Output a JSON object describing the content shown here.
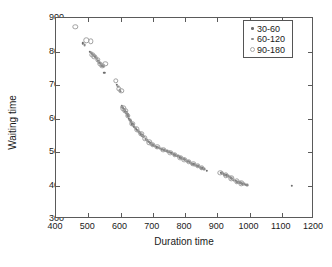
{
  "chart_data": {
    "type": "scatter",
    "title": "",
    "xlabel": "Duration time",
    "ylabel": "Waiting time",
    "xlim": [
      400,
      1200
    ],
    "ylim": [
      300,
      900
    ],
    "xticks": [
      400,
      500,
      600,
      700,
      800,
      900,
      1000,
      1100,
      1200
    ],
    "yticks": [
      300,
      400,
      500,
      600,
      700,
      800,
      900
    ],
    "grid": false,
    "legend_position": "top-right",
    "series": [
      {
        "name": "30-60",
        "color": "#6d6d6d",
        "marker": "dot",
        "points": [
          [
            484,
            824
          ],
          [
            505,
            800
          ],
          [
            511,
            793
          ],
          [
            521,
            786
          ],
          [
            527,
            779
          ],
          [
            534,
            766
          ],
          [
            541,
            759
          ],
          [
            550,
            737
          ],
          [
            588,
            700
          ],
          [
            597,
            684
          ],
          [
            604,
            636
          ],
          [
            607,
            632
          ],
          [
            610,
            628
          ],
          [
            613,
            622
          ],
          [
            617,
            618
          ],
          [
            621,
            612
          ],
          [
            626,
            600
          ],
          [
            631,
            592
          ],
          [
            637,
            583
          ],
          [
            642,
            576
          ],
          [
            648,
            570
          ],
          [
            651,
            566
          ],
          [
            657,
            560
          ],
          [
            663,
            552
          ],
          [
            668,
            548
          ],
          [
            673,
            545
          ],
          [
            681,
            536
          ],
          [
            687,
            530
          ],
          [
            692,
            527
          ],
          [
            698,
            522
          ],
          [
            705,
            518
          ],
          [
            712,
            514
          ],
          [
            719,
            512
          ],
          [
            729,
            508
          ],
          [
            740,
            504
          ],
          [
            748,
            501
          ],
          [
            757,
            497
          ],
          [
            766,
            493
          ],
          [
            774,
            489
          ],
          [
            783,
            484
          ],
          [
            791,
            480
          ],
          [
            800,
            476
          ],
          [
            809,
            472
          ],
          [
            818,
            468
          ],
          [
            827,
            463
          ],
          [
            836,
            459
          ],
          [
            845,
            455
          ],
          [
            854,
            451
          ],
          [
            868,
            444
          ],
          [
            912,
            437
          ],
          [
            920,
            434
          ],
          [
            929,
            431
          ],
          [
            938,
            426
          ],
          [
            946,
            420
          ],
          [
            957,
            414
          ],
          [
            968,
            409
          ],
          [
            978,
            405
          ],
          [
            988,
            402
          ],
          [
            1131,
            400
          ]
        ]
      },
      {
        "name": "60-120",
        "color": "#8a8a8a",
        "marker": "dot",
        "points": [
          [
            489,
            820
          ],
          [
            509,
            797
          ],
          [
            516,
            789
          ],
          [
            524,
            782
          ],
          [
            531,
            772
          ],
          [
            538,
            762
          ],
          [
            545,
            756
          ],
          [
            592,
            695
          ],
          [
            600,
            680
          ],
          [
            606,
            634
          ],
          [
            612,
            625
          ],
          [
            616,
            620
          ],
          [
            619,
            615
          ],
          [
            624,
            606
          ],
          [
            629,
            596
          ],
          [
            634,
            588
          ],
          [
            640,
            580
          ],
          [
            645,
            573
          ],
          [
            654,
            563
          ],
          [
            660,
            556
          ],
          [
            666,
            550
          ],
          [
            671,
            546
          ],
          [
            678,
            539
          ],
          [
            684,
            533
          ],
          [
            690,
            528
          ],
          [
            695,
            524
          ],
          [
            702,
            520
          ],
          [
            709,
            516
          ],
          [
            716,
            513
          ],
          [
            724,
            510
          ],
          [
            735,
            506
          ],
          [
            744,
            502
          ],
          [
            752,
            499
          ],
          [
            761,
            495
          ],
          [
            770,
            491
          ],
          [
            779,
            487
          ],
          [
            787,
            482
          ],
          [
            796,
            478
          ],
          [
            805,
            474
          ],
          [
            814,
            470
          ],
          [
            823,
            465
          ],
          [
            832,
            461
          ],
          [
            841,
            457
          ],
          [
            850,
            453
          ],
          [
            860,
            448
          ],
          [
            916,
            436
          ],
          [
            924,
            432
          ],
          [
            933,
            429
          ],
          [
            942,
            423
          ],
          [
            951,
            417
          ],
          [
            962,
            411
          ],
          [
            973,
            407
          ],
          [
            983,
            404
          ],
          [
            992,
            401
          ]
        ]
      },
      {
        "name": "90-180",
        "color": "#a0a0a0",
        "marker": "circle-open",
        "points": [
          [
            460,
            874
          ],
          [
            494,
            833
          ],
          [
            507,
            831
          ],
          [
            513,
            791
          ],
          [
            519,
            784
          ],
          [
            529,
            776
          ],
          [
            536,
            764
          ],
          [
            543,
            757
          ],
          [
            553,
            763
          ],
          [
            585,
            712
          ],
          [
            594,
            688
          ],
          [
            602,
            682
          ],
          [
            609,
            630
          ],
          [
            615,
            623
          ],
          [
            623,
            608
          ],
          [
            636,
            585
          ],
          [
            650,
            568
          ],
          [
            664,
            554
          ],
          [
            676,
            541
          ],
          [
            689,
            529
          ],
          [
            700,
            521
          ],
          [
            714,
            515
          ],
          [
            733,
            507
          ],
          [
            755,
            498
          ],
          [
            768,
            492
          ],
          [
            785,
            483
          ],
          [
            798,
            477
          ],
          [
            812,
            471
          ],
          [
            826,
            464
          ],
          [
            839,
            458
          ],
          [
            852,
            452
          ],
          [
            910,
            438
          ],
          [
            927,
            430
          ],
          [
            944,
            422
          ],
          [
            960,
            412
          ],
          [
            975,
            406
          ]
        ]
      }
    ]
  },
  "legend": {
    "entries": [
      {
        "label": "30-60"
      },
      {
        "label": "60-120"
      },
      {
        "label": "90-180"
      }
    ]
  },
  "axes": {
    "x_title": "Duration time",
    "y_title": "Waiting time",
    "x_tick_labels": [
      "400",
      "500",
      "600",
      "700",
      "800",
      "900",
      "1000",
      "1100",
      "1200"
    ],
    "y_tick_labels": [
      "300",
      "400",
      "500",
      "600",
      "700",
      "800",
      "900"
    ]
  }
}
